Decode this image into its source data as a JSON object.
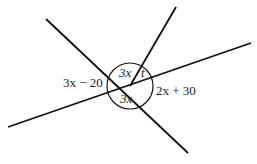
{
  "diagram": {
    "type": "intersecting-lines-angles",
    "center": {
      "x": 130,
      "y": 86
    },
    "circle_radius": 23,
    "lines": [
      {
        "id": "line-a",
        "x1": 46,
        "y1": 19,
        "x2": 188,
        "y2": 153
      },
      {
        "id": "line-b",
        "x1": 176,
        "y1": 7,
        "x2": 130,
        "y2": 86
      },
      {
        "id": "line-c",
        "x1": 8,
        "y1": 127,
        "x2": 251,
        "y2": 43
      }
    ],
    "labels": {
      "left": "3x − 20",
      "top": "3x",
      "top_right": "t",
      "right": "2x + 30",
      "bottom": "3x"
    },
    "stroke_color": "#111111"
  }
}
